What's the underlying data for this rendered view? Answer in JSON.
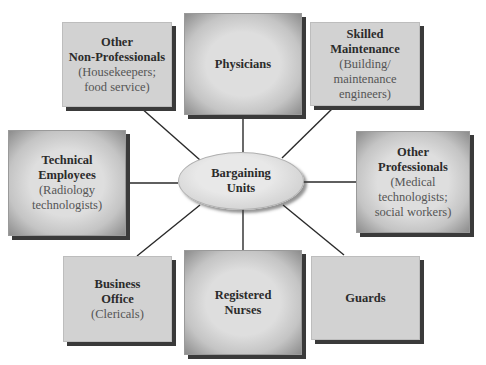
{
  "center": {
    "line1": "Bargaining",
    "line2": "Units"
  },
  "units": [
    {
      "id": "other-non-professionals",
      "title_lines": [
        "Other",
        "Non-Professionals"
      ],
      "sub_lines": [
        "(Housekeepers;",
        "food service)"
      ]
    },
    {
      "id": "physicians",
      "title_lines": [
        "Physicians"
      ],
      "sub_lines": []
    },
    {
      "id": "skilled-maintenance",
      "title_lines": [
        "Skilled",
        "Maintenance"
      ],
      "sub_lines": [
        "(Building/",
        "maintenance",
        "engineers)"
      ]
    },
    {
      "id": "technical-employees",
      "title_lines": [
        "Technical",
        "Employees"
      ],
      "sub_lines": [
        "(Radiology",
        "technologists)"
      ]
    },
    {
      "id": "other-professionals",
      "title_lines": [
        "Other",
        "Professionals"
      ],
      "sub_lines": [
        "(Medical",
        "technologists;",
        "social workers)"
      ]
    },
    {
      "id": "business-office",
      "title_lines": [
        "Business",
        "Office"
      ],
      "sub_lines": [
        "(Clericals)"
      ]
    },
    {
      "id": "registered-nurses",
      "title_lines": [
        "Registered",
        "Nurses"
      ],
      "sub_lines": []
    },
    {
      "id": "guards",
      "title_lines": [
        "Guards"
      ],
      "sub_lines": []
    }
  ],
  "colors": {
    "flat_box": "#d2d2d2",
    "shadow": "#3a3a3a",
    "line": "#2a2a2a",
    "text": "#2b2b2b",
    "subtext": "#555555"
  }
}
